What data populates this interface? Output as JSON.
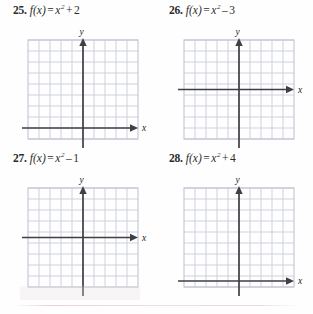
{
  "page": {
    "type": "textbook-exercise-set",
    "background_color": "#fefefe",
    "ink_color": "#231f20"
  },
  "style": {
    "grid_line_color": "#ccccdc",
    "grid_border_color": "#c4c4d4",
    "axis_color": "#3f3f44",
    "axis_label_color": "#231f20"
  },
  "problems": [
    {
      "number": "25.",
      "fn_name": "f",
      "fn_var": "x",
      "equals": "=",
      "base": "x",
      "exponent": "2",
      "operator": "+",
      "constant": "2",
      "equation_text": "f(x) = x² + 2",
      "graph": {
        "columns": 10,
        "rows": 10,
        "x_axis_row": 8.5,
        "y_axis_col": 5,
        "x_label": "x",
        "y_label": "y",
        "curve_drawn": false
      }
    },
    {
      "number": "26.",
      "fn_name": "f",
      "fn_var": "x",
      "equals": "=",
      "base": "x",
      "exponent": "2",
      "operator": "–",
      "constant": "3",
      "equation_text": "f(x) = x² − 3",
      "graph": {
        "columns": 10,
        "rows": 10,
        "x_axis_row": 5,
        "y_axis_col": 5,
        "x_label": "x",
        "y_label": "y",
        "curve_drawn": false
      }
    },
    {
      "number": "27.",
      "fn_name": "f",
      "fn_var": "x",
      "equals": "=",
      "base": "x",
      "exponent": "2",
      "operator": "–",
      "constant": "1",
      "equation_text": "f(x) = x² − 1",
      "graph": {
        "columns": 10,
        "rows": 10,
        "x_axis_row": 5,
        "y_axis_col": 5,
        "x_label": "x",
        "y_label": "y",
        "curve_drawn": false
      }
    },
    {
      "number": "28.",
      "fn_name": "f",
      "fn_var": "x",
      "equals": "=",
      "base": "x",
      "exponent": "2",
      "operator": "+",
      "constant": "4",
      "equation_text": "f(x) = x² + 4",
      "graph": {
        "columns": 10,
        "rows": 10,
        "x_axis_row": 9,
        "y_axis_col": 5,
        "x_label": "x",
        "y_label": "y",
        "curve_drawn": false
      }
    }
  ]
}
